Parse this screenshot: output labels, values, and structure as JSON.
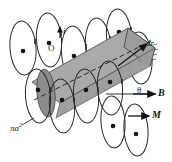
{
  "figure": {
    "type": "physics-diagram",
    "width": 172,
    "height": 162,
    "background": "#ffffff"
  },
  "labels": {
    "current": "i",
    "origin": "O",
    "thickness": "dr",
    "angle": "θ",
    "field": "B",
    "magnetization": "M",
    "cross_section_prefix": "πa",
    "cross_section_exponent": "2"
  },
  "colors": {
    "slab_fill": "#a9a9a9",
    "slab_dark_cap": "#8c8c8c",
    "slab_mid": "#9d9d9d",
    "stroke": "#1a1a1a",
    "loop_stroke": "#2b2b2b",
    "dot": "#111111",
    "background": "#ffffff"
  },
  "geometry": {
    "slab": {
      "description": "oblique gray cylinder drawn as a parallelogram slab tilted down-right to up-right",
      "corners": [
        [
          32,
          82
        ],
        [
          128,
          28
        ],
        [
          155,
          48
        ],
        [
          60,
          103
        ]
      ]
    },
    "axis_line": {
      "style": "dashed",
      "from": [
        34,
        100
      ],
      "to": [
        150,
        42
      ]
    },
    "loops_top_row": {
      "count": 6,
      "centers": [
        [
          23,
          48
        ],
        [
          49,
          40
        ],
        [
          73,
          52
        ],
        [
          97,
          44
        ],
        [
          118,
          35
        ],
        [
          139,
          57
        ]
      ]
    },
    "loops_bottom_row": {
      "count": 6,
      "centers": [
        [
          38,
          92
        ],
        [
          62,
          101
        ],
        [
          86,
          93
        ],
        [
          110,
          85
        ],
        [
          131,
          76
        ],
        [
          152,
          68
        ]
      ]
    },
    "arrows": [
      {
        "name": "current-arrow",
        "from": [
          60,
          36
        ],
        "to": [
          60,
          26
        ]
      },
      {
        "name": "dr-arrow",
        "from": [
          119,
          65
        ],
        "to": [
          148,
          43
        ]
      },
      {
        "name": "B-arrow",
        "from": [
          131,
          94
        ],
        "to": [
          154,
          94
        ]
      },
      {
        "name": "M-arrow",
        "from": [
          128,
          115
        ],
        "to": [
          150,
          115
        ]
      },
      {
        "name": "theta-baseline",
        "from": [
          108,
          94
        ],
        "to": [
          156,
          94
        ]
      }
    ]
  }
}
